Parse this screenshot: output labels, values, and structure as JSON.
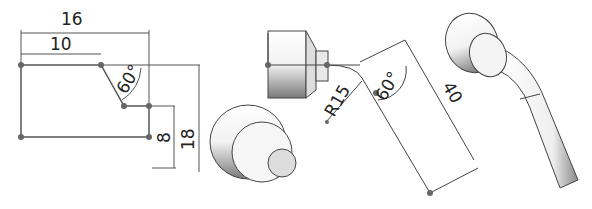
{
  "diagram": {
    "sketch1": {
      "dimensions": {
        "width_total": "16",
        "width_top": "10",
        "angle": "60°",
        "height_step": "8",
        "height_total": "18"
      }
    },
    "sketch2": {
      "dimensions": {
        "radius": "R15",
        "angle": "60°",
        "length": "40"
      }
    },
    "colors": {
      "line": "#555555",
      "dim_line": "#333333",
      "point": "#666666"
    }
  }
}
